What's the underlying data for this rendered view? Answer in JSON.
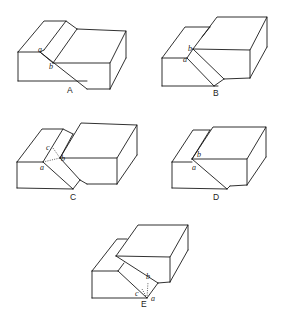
{
  "figure": {
    "panels": [
      {
        "id": "A",
        "caption": "A",
        "points": {
          "a": "a",
          "b": "b"
        }
      },
      {
        "id": "B",
        "caption": "B",
        "points": {
          "a": "a",
          "b": "b"
        }
      },
      {
        "id": "C",
        "caption": "C",
        "points": {
          "a": "a",
          "b": "b",
          "c": "c"
        }
      },
      {
        "id": "D",
        "caption": "D",
        "points": {
          "a": "a",
          "b": "b"
        }
      },
      {
        "id": "E",
        "caption": "E",
        "points": {
          "a": "a",
          "b": "b",
          "c": "c"
        }
      }
    ],
    "line_color": "#1a1a1a",
    "background": "#ffffff"
  }
}
